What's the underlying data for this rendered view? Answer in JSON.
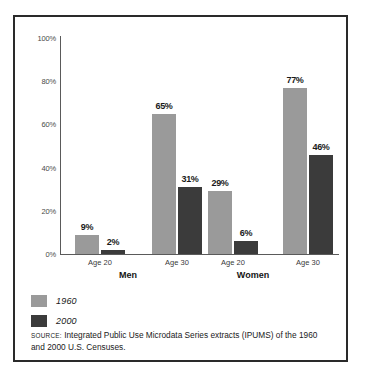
{
  "chart_data": {
    "type": "bar",
    "title": "",
    "xlabel": "",
    "ylabel": "",
    "ylim": [
      0,
      100
    ],
    "grid": false,
    "legend_position": "bottom-left",
    "ytick_labels": [
      "100%",
      "80%",
      "60%",
      "40%",
      "20%",
      "0%"
    ],
    "ytick_values": [
      100,
      80,
      60,
      40,
      20,
      0
    ],
    "groups": [
      "Men",
      "Women"
    ],
    "categories": [
      "Age 20",
      "Age 30",
      "Age 20",
      "Age 30"
    ],
    "category_groups": [
      "Men",
      "Men",
      "Women",
      "Women"
    ],
    "series": [
      {
        "name": "1960",
        "color": "#9a9a9a",
        "values": [
          9,
          65,
          29,
          77
        ],
        "value_labels": [
          "9%",
          "65%",
          "29%",
          "77%"
        ]
      },
      {
        "name": "2000",
        "color": "#3b3b3b",
        "values": [
          2,
          31,
          6,
          46
        ],
        "value_labels": [
          "2%",
          "31%",
          "6%",
          "46%"
        ]
      }
    ],
    "source_kicker": "source:",
    "source_text": "Integrated Public Use Microdata Series extracts (IPUMS) of the 1960 and 2000 U.S. Censuses."
  },
  "yticks": [
    {
      "label": "100%",
      "value": 100
    },
    {
      "label": "80%",
      "value": 80
    },
    {
      "label": "60%",
      "value": 60
    },
    {
      "label": "40%",
      "value": 40
    },
    {
      "label": "20%",
      "value": 20
    },
    {
      "label": "0%",
      "value": 0
    }
  ],
  "xticks": [
    {
      "label": "Age 20"
    },
    {
      "label": "Age 30"
    },
    {
      "label": "Age 20"
    },
    {
      "label": "Age 30"
    }
  ],
  "groups": [
    {
      "label": "Men"
    },
    {
      "label": "Women"
    }
  ],
  "bars": [
    {
      "label": "9%",
      "series": "1960",
      "value": 9
    },
    {
      "label": "2%",
      "series": "2000",
      "value": 2
    },
    {
      "label": "65%",
      "series": "1960",
      "value": 65
    },
    {
      "label": "31%",
      "series": "2000",
      "value": 31
    },
    {
      "label": "29%",
      "series": "1960",
      "value": 29
    },
    {
      "label": "6%",
      "series": "2000",
      "value": 6
    },
    {
      "label": "77%",
      "series": "1960",
      "value": 77
    },
    {
      "label": "46%",
      "series": "2000",
      "value": 46
    }
  ],
  "legend": [
    {
      "label": "1960",
      "color": "#9a9a9a"
    },
    {
      "label": "2000",
      "color": "#3b3b3b"
    }
  ],
  "source": {
    "kicker": "source:",
    "text": "Integrated Public Use Microdata Series extracts (IPUMS) of the 1960 and 2000 U.S. Censuses."
  }
}
